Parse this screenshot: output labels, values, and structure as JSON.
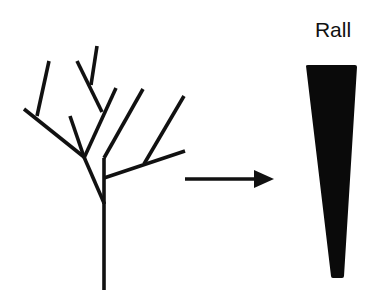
{
  "figure": {
    "type": "diagram",
    "colors": {
      "stroke": "#111111",
      "fill": "#0a0a0a",
      "background": "#ffffff"
    },
    "label": "Rall",
    "tree": {
      "stroke_width": 3.6,
      "segments": [
        {
          "name": "trunk",
          "x1": 104,
          "y1": 290,
          "x2": 104,
          "y2": 202
        },
        {
          "name": "left-junction",
          "x1": 104,
          "y1": 203,
          "x2": 84,
          "y2": 157
        },
        {
          "name": "right-stem",
          "x1": 104,
          "y1": 204,
          "x2": 104,
          "y2": 158
        },
        {
          "name": "right-stem-upper",
          "x1": 104,
          "y1": 158,
          "x2": 143,
          "y2": 89
        },
        {
          "name": "right-branch",
          "x1": 104,
          "y1": 178,
          "x2": 185,
          "y2": 151
        },
        {
          "name": "right-subbranch",
          "x1": 144,
          "y1": 164,
          "x2": 184,
          "y2": 96
        },
        {
          "name": "left-long-branch",
          "x1": 84,
          "y1": 157,
          "x2": 24,
          "y2": 109
        },
        {
          "name": "left-twig",
          "x1": 37,
          "y1": 116,
          "x2": 49,
          "y2": 61
        },
        {
          "name": "small-left-twig",
          "x1": 84,
          "y1": 157,
          "x2": 70,
          "y2": 116
        },
        {
          "name": "middle-branch",
          "x1": 84,
          "y1": 158,
          "x2": 116,
          "y2": 88
        },
        {
          "name": "middle-upper-branch",
          "x1": 102,
          "y1": 112,
          "x2": 77,
          "y2": 61
        },
        {
          "name": "middle-top-twig",
          "x1": 91,
          "y1": 85,
          "x2": 97,
          "y2": 46
        }
      ]
    },
    "arrow": {
      "x1": 185,
      "y1": 179,
      "x2": 256,
      "y2": 179,
      "stroke_width": 3.6,
      "head": {
        "tip_x": 274,
        "tip_y": 179,
        "back_x": 254,
        "half_width": 9
      }
    },
    "wedge": {
      "top_left": [
        306,
        65
      ],
      "top_right": [
        357,
        65
      ],
      "bottom_right": [
        344,
        278
      ],
      "bottom_left": [
        331,
        278
      ]
    }
  }
}
